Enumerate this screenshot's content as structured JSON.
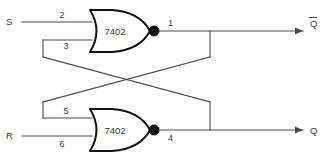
{
  "diagram": {
    "line_color": "#4a4a4a",
    "gate_color": "#111111",
    "background": "#ffffff"
  },
  "inputs": [
    {
      "label": "S",
      "pin": "2"
    },
    {
      "label": "R",
      "pin": "6"
    }
  ],
  "feedback_pins": [
    {
      "pin": "3"
    },
    {
      "pin": "5"
    }
  ],
  "gates": [
    {
      "part": "7402",
      "output_pin": "1"
    },
    {
      "part": "7402",
      "output_pin": "4"
    }
  ],
  "outputs": [
    {
      "label": "Q",
      "inverted": true
    },
    {
      "label": "Q",
      "inverted": false
    }
  ]
}
